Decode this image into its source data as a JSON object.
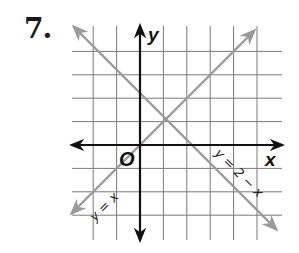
{
  "problem": {
    "number": "7."
  },
  "graph": {
    "x_axis_label": "x",
    "y_axis_label": "y",
    "origin_label": "O",
    "grid": {
      "x_range": [
        -3,
        5
      ],
      "y_range": [
        -4,
        4
      ],
      "unit_px": 23.4
    },
    "colors": {
      "grid": "#7a7a7a",
      "axes": "#111111",
      "lines": "#9a9a9a"
    },
    "lines": [
      {
        "name": "identity-line",
        "equation_label": "y = x",
        "slope": 1,
        "intercept": 0
      },
      {
        "name": "decreasing-line",
        "equation_label": "y = 2 − x",
        "slope": -1,
        "intercept": 2
      }
    ],
    "intersection": {
      "x": 1,
      "y": 1
    }
  }
}
